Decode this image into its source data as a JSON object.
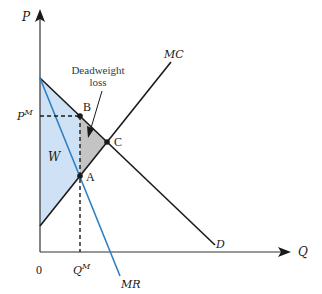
{
  "diagram": {
    "axes": {
      "y_label": "P",
      "x_label": "Q",
      "origin_label": "0"
    },
    "curves": {
      "demand": "D",
      "marginal_cost": "MC",
      "marginal_revenue": "MR"
    },
    "points": {
      "b": "B",
      "c": "C",
      "a": "A"
    },
    "levels": {
      "price_monopoly_base": "P",
      "price_monopoly_sup": "M",
      "quantity_monopoly_base": "Q",
      "quantity_monopoly_sup": "M"
    },
    "regions": {
      "welfare": "W",
      "deadweight_line1": "Deadweight",
      "deadweight_line2": "loss"
    },
    "colors": {
      "welfare_fill": "#cfe2f5",
      "deadweight_fill": "#c4c4c4",
      "mr_line": "#2f7fc1",
      "line": "#1a1a1a"
    }
  }
}
